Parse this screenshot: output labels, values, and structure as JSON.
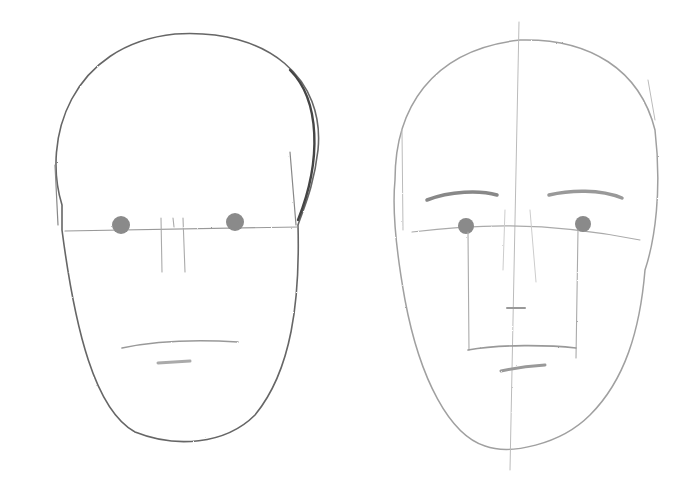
{
  "image": {
    "subject": "Pencil sketch of two face proportion studies",
    "background": "#ffffff",
    "pencil_dark": "#555555",
    "pencil_light": "#9a9a9a",
    "eye_fill": "#8a8a8a"
  },
  "faces": [
    {
      "label": "Left face: head outline with eye line, eyes, nose guides, and mouth"
    },
    {
      "label": "Right face: head outline with center line, brows, eyes, nose, mouth box, and lower lip"
    }
  ]
}
